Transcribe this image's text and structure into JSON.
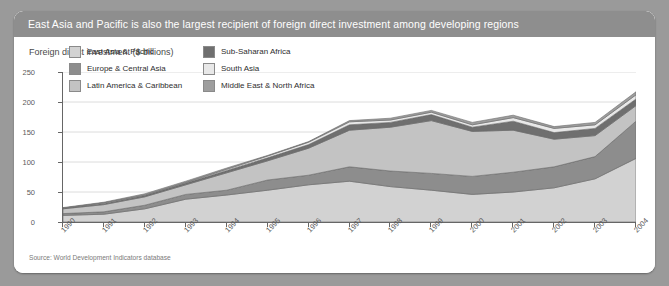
{
  "card": {
    "header_title": "East Asia and Pacific is also the largest recipient of foreign direct investment among developing regions",
    "subtitle": "Foreign direct investment ($ billions)",
    "source": "Source: World Development Indicators database"
  },
  "colors": {
    "header_bg": "#8e8e8e",
    "page_bg": "#9a9a9a",
    "card_bg": "#ffffff",
    "east_asia_pacific": "#d2d2d2",
    "europe_central_asia": "#8d8d8d",
    "latin_america_caribbean": "#c3c3c3",
    "sub_saharan_africa": "#6f6f6f",
    "south_asia": "#e8e8e8",
    "middle_east_north_africa": "#9e9e9e",
    "axis": "#666666",
    "gridline": "#dcdcdc"
  },
  "legend": {
    "items": [
      {
        "label": "East Asia & Pacific",
        "color": "#d2d2d2",
        "column": 0
      },
      {
        "label": "Sub-Saharan Africa",
        "color": "#6f6f6f",
        "column": 1
      },
      {
        "label": "Europe & Central Asia",
        "color": "#8d8d8d",
        "column": 0
      },
      {
        "label": "South Asia",
        "color": "#e8e8e8",
        "column": 1
      },
      {
        "label": "Latin America & Caribbean",
        "color": "#c3c3c3",
        "column": 0
      },
      {
        "label": "Middle East & North Africa",
        "color": "#9e9e9e",
        "column": 1
      }
    ]
  },
  "chart_data": {
    "type": "area",
    "stacked": true,
    "title": "Foreign direct investment ($ billions)",
    "xlabel": "",
    "ylabel": "",
    "ylim": [
      0,
      250
    ],
    "yticks": [
      0,
      50,
      100,
      150,
      200,
      250
    ],
    "grid": true,
    "legend_position": "top-left-inside",
    "categories": [
      "1990",
      "1991",
      "1992",
      "1993",
      "1994",
      "1995",
      "1996",
      "1997",
      "1998",
      "1999",
      "2000",
      "2001",
      "2002",
      "2003",
      "2004"
    ],
    "series": [
      {
        "name": "East Asia & Pacific",
        "color": "#d2d2d2",
        "values": [
          11,
          13,
          22,
          38,
          45,
          53,
          62,
          68,
          59,
          53,
          46,
          50,
          57,
          72,
          106
        ]
      },
      {
        "name": "Europe & Central Asia",
        "color": "#8d8d8d",
        "values": [
          3,
          4,
          6,
          8,
          8,
          17,
          16,
          24,
          26,
          28,
          30,
          33,
          35,
          37,
          62
        ]
      },
      {
        "name": "Latin America & Caribbean",
        "color": "#c3c3c3",
        "values": [
          8,
          12,
          14,
          16,
          29,
          32,
          45,
          61,
          73,
          88,
          75,
          70,
          46,
          35,
          26
        ]
      },
      {
        "name": "Sub-Saharan Africa",
        "color": "#6f6f6f",
        "values": [
          1,
          2,
          2,
          3,
          4,
          5,
          6,
          9,
          8,
          10,
          7,
          15,
          11,
          12,
          11
        ]
      },
      {
        "name": "South Asia",
        "color": "#e8e8e8",
        "values": [
          0,
          1,
          1,
          1,
          2,
          3,
          4,
          5,
          4,
          4,
          4,
          6,
          7,
          6,
          7
        ]
      },
      {
        "name": "Middle East & North Africa",
        "color": "#9e9e9e",
        "values": [
          1,
          1,
          2,
          2,
          2,
          1,
          1,
          2,
          3,
          3,
          4,
          4,
          3,
          4,
          5
        ]
      }
    ],
    "totals": [
      24,
      33,
      47,
      68,
      90,
      111,
      134,
      169,
      173,
      186,
      166,
      178,
      159,
      166,
      217
    ]
  }
}
